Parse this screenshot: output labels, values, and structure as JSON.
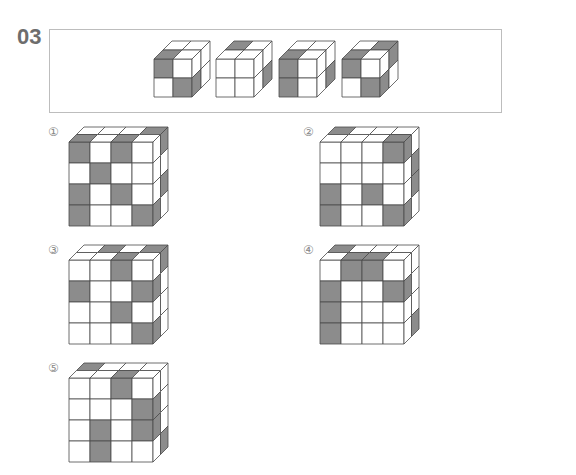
{
  "question": {
    "number": "03",
    "colors": {
      "shaded": "#8c8c8c",
      "white": "#ffffff",
      "line": "#4a4a4a",
      "label": "#6d6d6d",
      "border": "#bdbdbd"
    }
  },
  "given_cubes": [
    {
      "front": [
        [
          "G",
          "W"
        ],
        [
          "W",
          "G"
        ]
      ],
      "top": [
        [
          "W",
          "W"
        ],
        [
          "G",
          "W"
        ]
      ],
      "right": [
        [
          "W",
          "W"
        ],
        [
          "G",
          "W"
        ]
      ]
    },
    {
      "front": [
        [
          "W",
          "W"
        ],
        [
          "W",
          "W"
        ]
      ],
      "top": [
        [
          "G",
          "W"
        ],
        [
          "W",
          "W"
        ]
      ],
      "right": [
        [
          "W",
          "W"
        ],
        [
          "W",
          "G"
        ]
      ]
    },
    {
      "front": [
        [
          "G",
          "W"
        ],
        [
          "G",
          "W"
        ]
      ],
      "top": [
        [
          "W",
          "W"
        ],
        [
          "G",
          "W"
        ]
      ],
      "right": [
        [
          "W",
          "W"
        ],
        [
          "W",
          "G"
        ]
      ]
    },
    {
      "front": [
        [
          "G",
          "W"
        ],
        [
          "W",
          "G"
        ]
      ],
      "top": [
        [
          "W",
          "G"
        ],
        [
          "G",
          "W"
        ]
      ],
      "right": [
        [
          "W",
          "G"
        ],
        [
          "G",
          "W"
        ]
      ]
    }
  ],
  "options": [
    {
      "label": "①",
      "front": [
        [
          "G",
          "W",
          "G",
          "W"
        ],
        [
          "W",
          "G",
          "W",
          "W"
        ],
        [
          "G",
          "W",
          "G",
          "W"
        ],
        [
          "G",
          "W",
          "W",
          "G"
        ]
      ],
      "top_back": [
        "W",
        "W",
        "W",
        "G"
      ],
      "right": [
        [
          "W",
          "G"
        ],
        [
          "W",
          "W"
        ],
        [
          "W",
          "G"
        ],
        [
          "G",
          "W"
        ]
      ]
    },
    {
      "label": "②",
      "front": [
        [
          "W",
          "W",
          "W",
          "G"
        ],
        [
          "W",
          "W",
          "W",
          "W"
        ],
        [
          "G",
          "W",
          "G",
          "W"
        ],
        [
          "G",
          "W",
          "W",
          "G"
        ]
      ],
      "top_back": [
        "G",
        "W",
        "W",
        "W"
      ],
      "right": [
        [
          "G",
          "W"
        ],
        [
          "W",
          "G"
        ],
        [
          "W",
          "G"
        ],
        [
          "G",
          "W"
        ]
      ]
    },
    {
      "label": "③",
      "front": [
        [
          "W",
          "W",
          "G",
          "W"
        ],
        [
          "G",
          "W",
          "W",
          "G"
        ],
        [
          "W",
          "W",
          "G",
          "W"
        ],
        [
          "W",
          "W",
          "W",
          "G"
        ]
      ],
      "top_back": [
        "W",
        "G",
        "W",
        "G"
      ],
      "right": [
        [
          "W",
          "G"
        ],
        [
          "G",
          "W"
        ],
        [
          "W",
          "W"
        ],
        [
          "G",
          "W"
        ]
      ]
    },
    {
      "label": "④",
      "front": [
        [
          "W",
          "G",
          "G",
          "W"
        ],
        [
          "G",
          "W",
          "W",
          "G"
        ],
        [
          "G",
          "W",
          "W",
          "W"
        ],
        [
          "G",
          "W",
          "W",
          "W"
        ]
      ],
      "top_back": [
        "G",
        "W",
        "W",
        "W"
      ],
      "right": [
        [
          "W",
          "W"
        ],
        [
          "G",
          "W"
        ],
        [
          "W",
          "W"
        ],
        [
          "W",
          "G"
        ]
      ]
    },
    {
      "label": "⑤",
      "front": [
        [
          "W",
          "W",
          "G",
          "W"
        ],
        [
          "W",
          "W",
          "W",
          "G"
        ],
        [
          "W",
          "G",
          "W",
          "G"
        ],
        [
          "W",
          "G",
          "W",
          "W"
        ]
      ],
      "top_back": [
        "G",
        "W",
        "W",
        "W"
      ],
      "right": [
        [
          "W",
          "W"
        ],
        [
          "G",
          "W"
        ],
        [
          "G",
          "W"
        ],
        [
          "W",
          "G"
        ]
      ]
    }
  ]
}
